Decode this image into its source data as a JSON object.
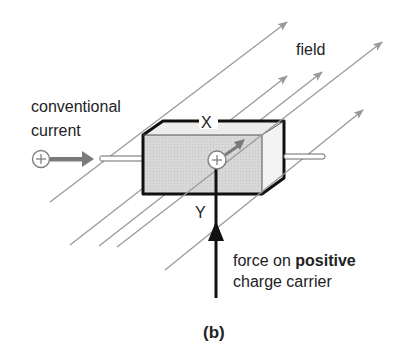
{
  "figure": {
    "panel_label": "(b)",
    "labels": {
      "field": "field",
      "conventional_current_line1": "conventional",
      "conventional_current_line2": "current",
      "axis_x": "X",
      "axis_y": "Y",
      "force_line1_prefix": "force on ",
      "force_line1_bold": "positive",
      "force_line2": "charge carrier"
    },
    "symbols": {
      "charge_sign": "+"
    },
    "icons": {
      "current_charge": "plus-circle-icon",
      "carrier_charge": "plus-circle-icon",
      "force_arrow": "arrow-up-icon",
      "current_arrow": "arrow-right-icon",
      "field_lines": "diagonal-arrow-icon"
    },
    "colors": {
      "field_line": "#9a9a9a",
      "box_front": "#d4d4d4",
      "box_top": "#ececec",
      "box_side": "#f2f2f2",
      "outline": "#111111",
      "current_arrow": "#7a7a7a",
      "text": "#222222"
    }
  }
}
